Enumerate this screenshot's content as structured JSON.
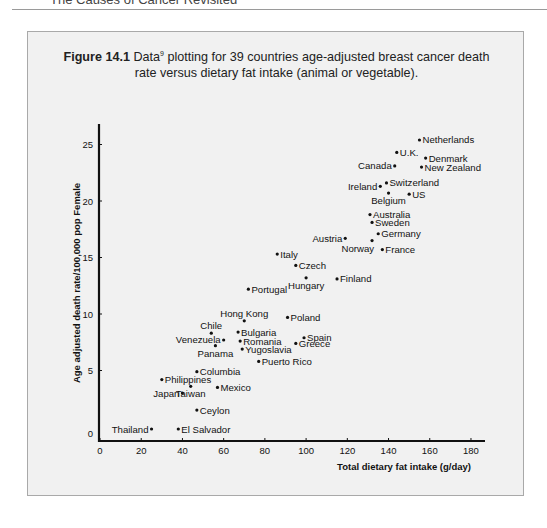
{
  "page": {
    "header_text": "The Causes of Cancer Revisited"
  },
  "figure": {
    "label": "Figure 14.1",
    "caption_line1": "Data",
    "caption_sup": "9",
    "caption_line1_rest": " plotting for 39 countries age-adjusted breast cancer death",
    "caption_line2": "rate versus dietary fat intake (animal or vegetable)."
  },
  "chart_data": {
    "type": "scatter",
    "xlabel": "Total dietary fat intake (g/day)",
    "ylabel": "Age adjusted death rate/100,000 pop  Female",
    "xlim": [
      0,
      185
    ],
    "ylim": [
      0,
      27
    ],
    "x_ticks": [
      0,
      20,
      40,
      60,
      80,
      100,
      120,
      140,
      160,
      180
    ],
    "y_ticks": [
      0,
      5,
      10,
      15,
      20,
      25
    ],
    "grid": false,
    "legend": null,
    "points": [
      {
        "label": "Netherlands",
        "x": 155,
        "y": 25.4,
        "pos": "right"
      },
      {
        "label": "U.K.",
        "x": 144,
        "y": 24.3,
        "pos": "right"
      },
      {
        "label": "Denmark",
        "x": 158,
        "y": 23.8,
        "pos": "right"
      },
      {
        "label": "New Zealand",
        "x": 156,
        "y": 23.0,
        "pos": "right"
      },
      {
        "label": "Canada",
        "x": 143,
        "y": 23.1,
        "pos": "left"
      },
      {
        "label": "Switzerland",
        "x": 139,
        "y": 21.6,
        "pos": "right"
      },
      {
        "label": "Ireland",
        "x": 136,
        "y": 21.3,
        "pos": "left"
      },
      {
        "label": "Belgium",
        "x": 140,
        "y": 20.7,
        "pos": "below"
      },
      {
        "label": "US",
        "x": 150,
        "y": 20.6,
        "pos": "right"
      },
      {
        "label": "Australia",
        "x": 131,
        "y": 18.8,
        "pos": "right"
      },
      {
        "label": "Sweden",
        "x": 132,
        "y": 18.1,
        "pos": "right"
      },
      {
        "label": "Germany",
        "x": 135,
        "y": 17.1,
        "pos": "right"
      },
      {
        "label": "Austria",
        "x": 119,
        "y": 16.7,
        "pos": "left"
      },
      {
        "label": "Norway",
        "x": 132,
        "y": 16.5,
        "pos": "below-left"
      },
      {
        "label": "France",
        "x": 137,
        "y": 15.7,
        "pos": "right"
      },
      {
        "label": "Italy",
        "x": 86,
        "y": 15.3,
        "pos": "right"
      },
      {
        "label": "Czech",
        "x": 95,
        "y": 14.3,
        "pos": "right"
      },
      {
        "label": "Hungary",
        "x": 100,
        "y": 13.2,
        "pos": "below"
      },
      {
        "label": "Finland",
        "x": 115,
        "y": 13.1,
        "pos": "right"
      },
      {
        "label": "Portugal",
        "x": 72,
        "y": 12.2,
        "pos": "right"
      },
      {
        "label": "Poland",
        "x": 91,
        "y": 9.7,
        "pos": "right"
      },
      {
        "label": "Hong Kong",
        "x": 70,
        "y": 9.4,
        "pos": "above"
      },
      {
        "label": "Chile",
        "x": 54,
        "y": 8.3,
        "pos": "above"
      },
      {
        "label": "Bulgaria",
        "x": 67,
        "y": 8.4,
        "pos": "right"
      },
      {
        "label": "Spain",
        "x": 99,
        "y": 7.9,
        "pos": "right"
      },
      {
        "label": "Venezuela",
        "x": 60,
        "y": 7.7,
        "pos": "left"
      },
      {
        "label": "Romania",
        "x": 68,
        "y": 7.6,
        "pos": "right"
      },
      {
        "label": "Greece",
        "x": 95,
        "y": 7.4,
        "pos": "right"
      },
      {
        "label": "Panama",
        "x": 56,
        "y": 7.2,
        "pos": "below"
      },
      {
        "label": "Yugoslavia",
        "x": 69,
        "y": 6.9,
        "pos": "right"
      },
      {
        "label": "Puerto Rico",
        "x": 77,
        "y": 5.8,
        "pos": "right"
      },
      {
        "label": "Columbia",
        "x": 47,
        "y": 4.9,
        "pos": "right"
      },
      {
        "label": "Philippines",
        "x": 30,
        "y": 4.2,
        "pos": "right"
      },
      {
        "label": "Taiwan",
        "x": 44,
        "y": 3.6,
        "pos": "below"
      },
      {
        "label": "Mexico",
        "x": 57,
        "y": 3.5,
        "pos": "right"
      },
      {
        "label": "Japan",
        "x": 40,
        "y": 3.0,
        "pos": "left"
      },
      {
        "label": "Ceylon",
        "x": 47,
        "y": 1.5,
        "pos": "right"
      },
      {
        "label": "Thailand",
        "x": 25,
        "y": 0.0,
        "pos": "left"
      },
      {
        "label": "El Salvador",
        "x": 38,
        "y": 0.0,
        "pos": "right"
      }
    ]
  },
  "colors": {
    "box_background": "#f1f1f1",
    "box_border": "#a9a9a9",
    "ink": "#111111"
  }
}
